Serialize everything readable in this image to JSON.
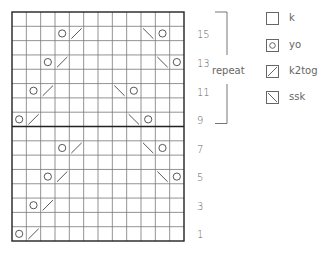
{
  "chart": {
    "columns": 12,
    "rows": 16,
    "divider_after_row_from_bottom": 8,
    "colors": {
      "grid": "#777777",
      "border": "#222222",
      "symbol": "#444444",
      "text": "#666666"
    },
    "cells": [
      {
        "row": 15,
        "col": 4,
        "symbol": "yo"
      },
      {
        "row": 15,
        "col": 5,
        "symbol": "k2tog"
      },
      {
        "row": 15,
        "col": 10,
        "symbol": "ssk"
      },
      {
        "row": 15,
        "col": 11,
        "symbol": "yo"
      },
      {
        "row": 13,
        "col": 3,
        "symbol": "yo"
      },
      {
        "row": 13,
        "col": 4,
        "symbol": "k2tog"
      },
      {
        "row": 13,
        "col": 11,
        "symbol": "ssk"
      },
      {
        "row": 13,
        "col": 12,
        "symbol": "yo"
      },
      {
        "row": 11,
        "col": 2,
        "symbol": "yo"
      },
      {
        "row": 11,
        "col": 3,
        "symbol": "k2tog"
      },
      {
        "row": 11,
        "col": 8,
        "symbol": "ssk"
      },
      {
        "row": 11,
        "col": 9,
        "symbol": "yo"
      },
      {
        "row": 9,
        "col": 1,
        "symbol": "yo"
      },
      {
        "row": 9,
        "col": 2,
        "symbol": "k2tog"
      },
      {
        "row": 9,
        "col": 9,
        "symbol": "ssk"
      },
      {
        "row": 9,
        "col": 10,
        "symbol": "yo"
      },
      {
        "row": 7,
        "col": 4,
        "symbol": "yo"
      },
      {
        "row": 7,
        "col": 5,
        "symbol": "k2tog"
      },
      {
        "row": 7,
        "col": 10,
        "symbol": "ssk"
      },
      {
        "row": 7,
        "col": 11,
        "symbol": "yo"
      },
      {
        "row": 5,
        "col": 3,
        "symbol": "yo"
      },
      {
        "row": 5,
        "col": 4,
        "symbol": "k2tog"
      },
      {
        "row": 5,
        "col": 11,
        "symbol": "ssk"
      },
      {
        "row": 5,
        "col": 12,
        "symbol": "yo"
      },
      {
        "row": 3,
        "col": 2,
        "symbol": "yo"
      },
      {
        "row": 3,
        "col": 3,
        "symbol": "k2tog"
      },
      {
        "row": 1,
        "col": 1,
        "symbol": "yo"
      },
      {
        "row": 1,
        "col": 2,
        "symbol": "k2tog"
      }
    ]
  },
  "row_labels": [
    "15",
    "13",
    "11",
    "9",
    "7",
    "5",
    "3",
    "1"
  ],
  "repeat": {
    "label": "repeat",
    "from_row": 9,
    "to_row": 16
  },
  "legend": [
    {
      "symbol": "k",
      "label": "k",
      "icon": "empty-square-icon"
    },
    {
      "symbol": "yo",
      "label": "yo",
      "icon": "circle-in-square-icon"
    },
    {
      "symbol": "k2tog",
      "label": "k2tog",
      "icon": "slash-right-square-icon"
    },
    {
      "symbol": "ssk",
      "label": "ssk",
      "icon": "slash-left-square-icon"
    }
  ]
}
